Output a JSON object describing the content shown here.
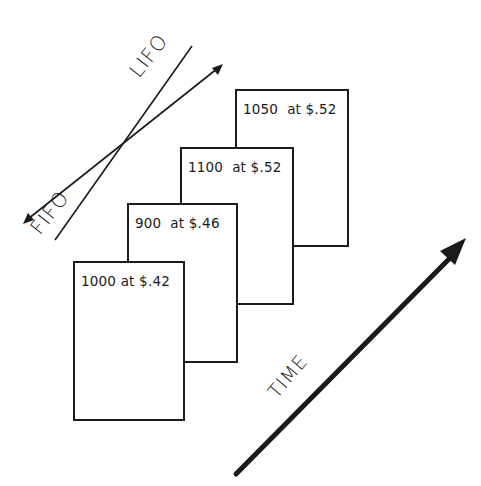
{
  "diagram": {
    "type": "inventory-layers",
    "direction_labels": {
      "lifo": "LIFO",
      "fifo": "FIFO",
      "time": "TIME"
    },
    "layers": [
      {
        "label": "1000 at $.42",
        "quantity": 1000,
        "unit_cost": "$.42"
      },
      {
        "label": "900  at $.46",
        "quantity": 900,
        "unit_cost": "$.46"
      },
      {
        "label": "1100  at $.52",
        "quantity": 1100,
        "unit_cost": "$.52"
      },
      {
        "label": "1050  at $.52",
        "quantity": 1050,
        "unit_cost": "$.52"
      }
    ],
    "colors": {
      "ink": "#1a1a1a",
      "background": "#ffffff"
    }
  }
}
